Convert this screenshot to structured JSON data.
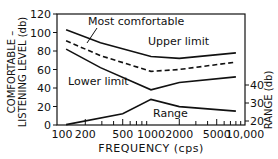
{
  "chart_data": {
    "type": "line",
    "title": "",
    "xlabel": "FREQUENCY (cps)",
    "ylabel_left": [
      "COMFORTABLE –",
      "LISTENING LEVEL (db)"
    ],
    "ylabel_right": "RANGE (db)",
    "x_scale": "log",
    "xlim": [
      100,
      10000
    ],
    "x_ticks": [
      100,
      200,
      500,
      1000,
      2000,
      5000,
      10000
    ],
    "x_tick_labels": [
      "100",
      "200",
      "500",
      "1000",
      "2000",
      "5000",
      "10,000"
    ],
    "ylim_left": [
      0,
      120
    ],
    "y_ticks_left": [
      0,
      20,
      40,
      60,
      80,
      100,
      120
    ],
    "y_ticks_right": [
      20,
      30,
      40
    ],
    "grid": false,
    "series": [
      {
        "name": "Upper limit",
        "axis": "left",
        "style": "solid",
        "x": [
          125,
          290,
          1000,
          2000,
          8000
        ],
        "values": [
          103,
          89,
          74,
          72,
          78
        ]
      },
      {
        "name": "Most comfortable",
        "axis": "left",
        "style": "dashed",
        "x": [
          125,
          290,
          1000,
          2000,
          8000
        ],
        "values": [
          91,
          75,
          58,
          60,
          68
        ]
      },
      {
        "name": "Lower limit",
        "axis": "left",
        "style": "solid",
        "x": [
          125,
          290,
          1000,
          2000,
          8000
        ],
        "values": [
          82,
          62,
          38,
          46,
          52
        ]
      },
      {
        "name": "Range",
        "axis": "right",
        "style": "solid",
        "x": [
          125,
          500,
          1000,
          2000,
          8000
        ],
        "values": [
          18,
          24,
          32,
          28,
          25.5
        ]
      }
    ],
    "annotations": [
      {
        "text": "Most comfortable",
        "x": 88,
        "y": 25
      },
      {
        "text": "Upper limit",
        "x": 148,
        "y": 45
      },
      {
        "text": "Lower limit",
        "x": 68,
        "y": 85
      },
      {
        "text": "Range",
        "x": 153,
        "y": 117
      }
    ]
  }
}
